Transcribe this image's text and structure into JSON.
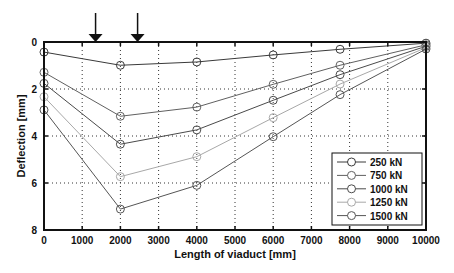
{
  "chart_data": {
    "type": "line",
    "title": "",
    "xlabel": "Length of viaduct [mm]",
    "ylabel": "Deflection [mm]",
    "xlim": [
      0,
      10000
    ],
    "ylim": [
      0,
      8
    ],
    "y_inverted": true,
    "grid": true,
    "legend_position": "lower right",
    "x_ticks": [
      "0",
      "1000",
      "2000",
      "3000",
      "4000",
      "5000",
      "6000",
      "7000",
      "8000",
      "9000",
      "10000"
    ],
    "y_ticks": [
      "0",
      "2",
      "4",
      "6",
      "8"
    ],
    "x": [
      0,
      2000,
      4000,
      6000,
      7750,
      10000
    ],
    "series": [
      {
        "name": "250 kN",
        "color": "#3a3a3a",
        "values": [
          0.43,
          0.99,
          0.85,
          0.55,
          0.31,
          0.05
        ]
      },
      {
        "name": "750 kN",
        "color": "#606060",
        "values": [
          1.29,
          3.16,
          2.77,
          1.8,
          0.99,
          0.12
        ]
      },
      {
        "name": "1000 kN",
        "color": "#4a4a4a",
        "values": [
          1.76,
          4.35,
          3.74,
          2.48,
          1.39,
          0.18
        ]
      },
      {
        "name": "1250 kN",
        "color": "#a8a8a8",
        "values": [
          2.33,
          5.73,
          4.88,
          3.22,
          1.79,
          0.24
        ]
      },
      {
        "name": "1500 kN",
        "color": "#555555",
        "values": [
          2.89,
          7.11,
          6.1,
          4.03,
          2.24,
          0.3
        ]
      }
    ],
    "annotations": [
      {
        "type": "arrow-down",
        "x": 1350
      },
      {
        "type": "arrow-down",
        "x": 2450
      }
    ]
  }
}
